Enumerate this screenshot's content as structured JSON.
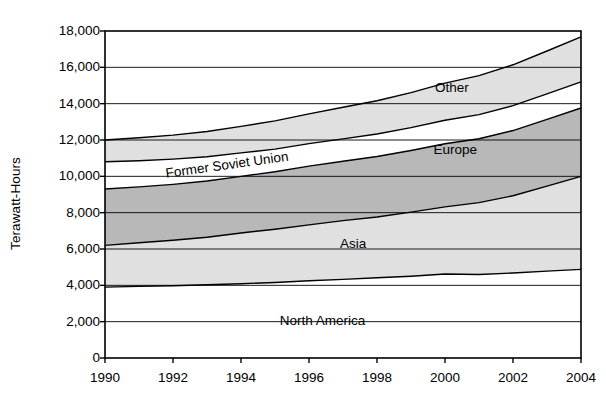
{
  "chart_data": {
    "type": "area",
    "stacked": true,
    "title": "",
    "subtitle": "",
    "xlabel": "",
    "ylabel": "Terawatt-Hours",
    "xlim": [
      1990,
      2004
    ],
    "ylim": [
      0,
      18000
    ],
    "ytick_labels": [
      "18,000",
      "16,000",
      "14,000",
      "12,000",
      "10,000",
      "8,000",
      "6,000",
      "4,000",
      "2,000",
      "0"
    ],
    "ytick_values": [
      18000,
      16000,
      14000,
      12000,
      10000,
      8000,
      6000,
      4000,
      2000,
      0
    ],
    "xtick_labels": [
      "1990",
      "1992",
      "1994",
      "1996",
      "1998",
      "2000",
      "2002",
      "2004"
    ],
    "xtick_values": [
      1990,
      1992,
      1994,
      1996,
      1998,
      2000,
      2002,
      2004
    ],
    "grid": "horizontal",
    "legend": "inline-band-labels",
    "x": [
      1990,
      1991,
      1992,
      1993,
      1994,
      1995,
      1996,
      1997,
      1998,
      1999,
      2000,
      2001,
      2002,
      2003,
      2004
    ],
    "series": [
      {
        "name": "North America",
        "fill": "#ffffff",
        "label_x": 1996.4,
        "label_y": 2050,
        "values": [
          3900,
          3940,
          3980,
          4030,
          4090,
          4160,
          4250,
          4330,
          4420,
          4500,
          4620,
          4600,
          4680,
          4780,
          4880
        ]
      },
      {
        "name": "Asia",
        "fill": "#e0e0e0",
        "label_x": 1997.3,
        "label_y": 6250,
        "values": [
          2300,
          2400,
          2500,
          2620,
          2790,
          2930,
          3080,
          3230,
          3340,
          3530,
          3700,
          3950,
          4250,
          4680,
          5120
        ]
      },
      {
        "name": "Europe",
        "fill": "#b8b8b8",
        "label_x": 2000.3,
        "label_y": 11450,
        "values": [
          3100,
          3080,
          3080,
          3090,
          3120,
          3160,
          3230,
          3270,
          3330,
          3390,
          3470,
          3520,
          3590,
          3680,
          3760
        ]
      },
      {
        "name": "Former Soviet Union",
        "fill": "#ffffff",
        "label_x": 1993.6,
        "label_y": 10620,
        "label_rotation": -8,
        "values": [
          1500,
          1440,
          1390,
          1340,
          1290,
          1250,
          1240,
          1230,
          1240,
          1260,
          1300,
          1330,
          1370,
          1400,
          1440
        ]
      },
      {
        "name": "Other",
        "fill": "#e0e0e0",
        "label_x": 2000.2,
        "label_y": 14850,
        "values": [
          1200,
          1260,
          1320,
          1390,
          1460,
          1550,
          1640,
          1740,
          1830,
          1930,
          2040,
          2140,
          2250,
          2360,
          2480
        ]
      }
    ]
  },
  "axes": {
    "y_title": "Terawatt-Hours"
  }
}
